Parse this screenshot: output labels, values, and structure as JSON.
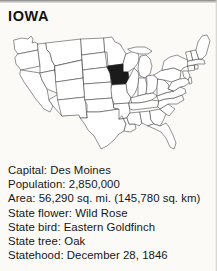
{
  "page": {
    "title": "IOWA",
    "background_color": "#fbfaf7",
    "text_color": "#171717"
  },
  "map": {
    "name": "united-states-outline-map",
    "caption_alt": "Outline map of the contiguous United States with Iowa filled in black",
    "highlighted_state": "Iowa",
    "highlight_color": "#1b1b1b",
    "outline_color": "#4a4a4a",
    "fill_color": "#ffffff"
  },
  "facts": [
    {
      "label": "Capital",
      "value": "Des Moines",
      "line": "Capital: Des Moines"
    },
    {
      "label": "Population",
      "value": "2,850,000",
      "line": "Population: 2,850,000"
    },
    {
      "label": "Area",
      "value": "56,290 sq. mi. (145,780 sq. km)",
      "line": "Area: 56,290 sq. mi. (145,780 sq. km)"
    },
    {
      "label": "State flower",
      "value": "Wild Rose",
      "line": "State flower: Wild Rose"
    },
    {
      "label": "State bird",
      "value": "Eastern Goldfinch",
      "line": "State bird: Eastern Goldfinch"
    },
    {
      "label": "State tree",
      "value": "Oak",
      "line": "State tree: Oak"
    },
    {
      "label": "Statehood",
      "value": "December 28, 1846",
      "line": "Statehood: December 28, 1846"
    }
  ]
}
